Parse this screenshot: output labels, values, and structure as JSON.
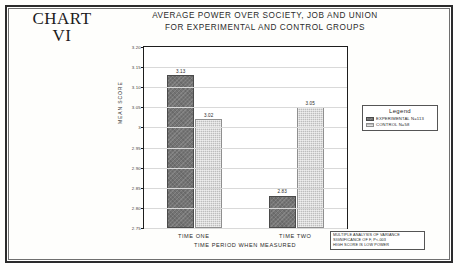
{
  "heading": {
    "line1": "CHART",
    "line2": "VI"
  },
  "title": {
    "line1": "AVERAGE POWER OVER SOCIETY, JOB AND UNION",
    "line2": "FOR EXPERIMENTAL AND CONTROL GROUPS"
  },
  "legend": {
    "title": "Legend",
    "items": [
      {
        "label": "EXPERIMENTAL  N=113",
        "color": "#747474"
      },
      {
        "label": "CONTROL  N=58",
        "color": "#bdbdbd"
      }
    ]
  },
  "footnote": {
    "line1": "MULTIPLE ANALYSIS OF VARIANCE",
    "line2": "SIGNIFICANCE OF F, P<.003",
    "line3": "HIGH SCORE IS LOW POWER"
  },
  "chart_data": {
    "type": "bar",
    "title": "AVERAGE POWER OVER SOCIETY, JOB AND UNION FOR EXPERIMENTAL AND CONTROL GROUPS",
    "xlabel": "TIME PERIOD WHEN MEASURED",
    "ylabel": "MEAN SCORE",
    "categories": [
      "TIME ONE",
      "TIME TWO"
    ],
    "series": [
      {
        "name": "EXPERIMENTAL  N=113",
        "values": [
          3.13,
          2.83
        ],
        "color": "#747474"
      },
      {
        "name": "CONTROL  N=58",
        "values": [
          3.02,
          3.05
        ],
        "color": "#bdbdbd"
      }
    ],
    "ylim": [
      2.75,
      3.2
    ],
    "yticks": [
      "3.20",
      "3.15",
      "3.10",
      "3.05",
      "3",
      "2.95",
      "2.90",
      "2.85",
      "2.80",
      "2.75"
    ],
    "ytick_values": [
      3.2,
      3.15,
      3.1,
      3.05,
      3.0,
      2.95,
      2.9,
      2.85,
      2.8,
      2.75
    ],
    "grid": true,
    "legend_position": "right",
    "annotations": [
      "MULTIPLE ANALYSIS OF VARIANCE",
      "SIGNIFICANCE OF F, P<.003",
      "HIGH SCORE IS LOW POWER"
    ]
  }
}
